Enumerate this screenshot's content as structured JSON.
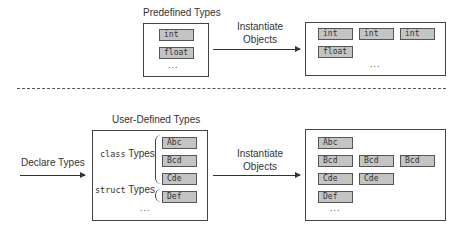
{
  "top": {
    "predefined_title": "Predefined Types",
    "predefined_items": [
      "int",
      "float"
    ],
    "ellipsis": "...",
    "arrow_label_line1": "Instantiate",
    "arrow_label_line2": "Objects",
    "objects": [
      [
        "int",
        "int",
        "int"
      ],
      [
        "float"
      ]
    ]
  },
  "bottom": {
    "declare_label": "Declare Types",
    "user_title": "User-Defined Types",
    "class_label_kw": "class",
    "class_label_rest": " Types",
    "struct_label_kw": "struct",
    "struct_label_rest": " Types",
    "class_items": [
      "Abc",
      "Bcd",
      "Cde"
    ],
    "struct_items": [
      "Def"
    ],
    "ellipsis": "...",
    "arrow_label_line1": "Instantiate",
    "arrow_label_line2": "Objects",
    "objects": [
      [
        "Abc"
      ],
      [
        "Bcd",
        "Bcd",
        "Bcd"
      ],
      [
        "Cde",
        "Cde"
      ],
      [
        "Def"
      ]
    ]
  }
}
